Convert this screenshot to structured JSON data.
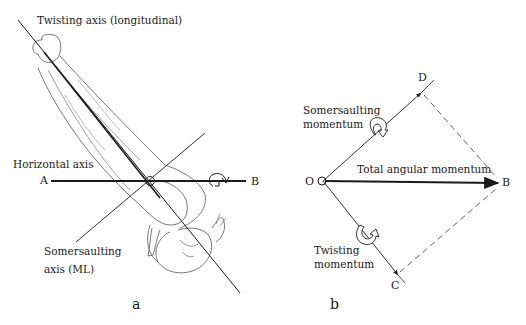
{
  "panel_a": {
    "caption": "a",
    "labels": {
      "twisting_axis": "Twisting axis (longitudinal)",
      "horizontal_axis": "Horizontal axis",
      "somersaulting_axis_line1": "Somersaulting",
      "somersaulting_axis_line2": "axis (ML)"
    },
    "points": {
      "A": "A",
      "B": "B"
    }
  },
  "panel_b": {
    "caption": "b",
    "labels": {
      "somersaulting_momentum_line1": "Somersaulting",
      "somersaulting_momentum_line2": "momentum",
      "total_angular_momentum": "Total angular momentum",
      "twisting_momentum_line1": "Twisting",
      "twisting_momentum_line2": "momentum"
    },
    "points": {
      "O": "O",
      "B": "B",
      "C": "C",
      "D": "D"
    }
  },
  "colors": {
    "ink": "#1a1a1a",
    "figure_line": "#555555",
    "background": "#ffffff"
  }
}
